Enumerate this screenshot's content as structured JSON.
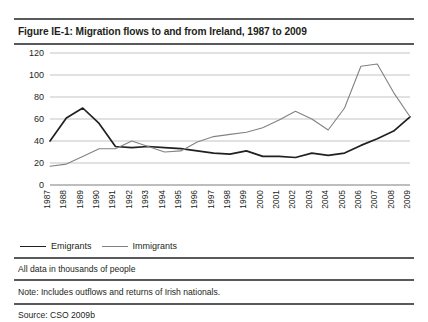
{
  "figure": {
    "title": "Figure IE-1:  Migration flows to and from Ireland, 1987 to 2009",
    "units_note": "All data in thousands of people",
    "note": "Note: Includes outflows and returns of Irish nationals.",
    "source": "Source: CSO 2009b"
  },
  "legend": {
    "emigrants_label": "Emigrants",
    "immigrants_label": "Immigrants"
  },
  "colors": {
    "emigrants_line": "#231f20",
    "immigrants_line": "#808285",
    "gridline": "#a7a9ac",
    "axis": "#6d6e71",
    "rule": "#58595b",
    "text": "#231f20",
    "background": "#ffffff"
  },
  "chart_data": {
    "type": "line",
    "title": "Migration flows to and from Ireland, 1987 to 2009",
    "xlabel": "",
    "ylabel": "",
    "ylim": [
      0,
      120
    ],
    "yticks": [
      0,
      20,
      40,
      60,
      80,
      100,
      120
    ],
    "grid": true,
    "legend_position": "bottom-left",
    "units": "thousands of people",
    "categories": [
      "1987",
      "1988",
      "1989",
      "1990",
      "1991",
      "1992",
      "1993",
      "1994",
      "1995",
      "1996",
      "1997",
      "1998",
      "1999",
      "2000",
      "2001",
      "2002",
      "2003",
      "2004",
      "2005",
      "2006",
      "2007",
      "2008",
      "2009"
    ],
    "series": [
      {
        "name": "Emigrants",
        "color": "#231f20",
        "values": [
          40,
          61,
          70,
          56,
          35,
          34,
          35,
          34,
          33,
          31,
          29,
          28,
          31,
          26,
          26,
          25,
          29,
          27,
          29,
          36,
          42,
          49,
          62
        ]
      },
      {
        "name": "Immigrants",
        "color": "#808285",
        "values": [
          17,
          19,
          26,
          33,
          33,
          40,
          35,
          30,
          31,
          39,
          44,
          46,
          48,
          52,
          59,
          67,
          60,
          50,
          70,
          108,
          110,
          84,
          62
        ]
      }
    ]
  }
}
